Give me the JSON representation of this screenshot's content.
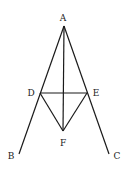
{
  "diagram": {
    "points": {
      "A": {
        "label": "A",
        "x": 64,
        "y": 26,
        "lx": 63,
        "ly": 21
      },
      "B": {
        "label": "B",
        "x": 19,
        "y": 154,
        "lx": 11,
        "ly": 159
      },
      "C": {
        "label": "C",
        "x": 109,
        "y": 154,
        "lx": 117,
        "ly": 159
      },
      "D": {
        "label": "D",
        "x": 40,
        "y": 93,
        "lx": 31,
        "ly": 96
      },
      "E": {
        "label": "E",
        "x": 87,
        "y": 93,
        "lx": 96,
        "ly": 96
      },
      "F": {
        "label": "F",
        "x": 63,
        "y": 131,
        "lx": 63,
        "ly": 146
      }
    },
    "segments": [
      [
        "A",
        "B"
      ],
      [
        "A",
        "C"
      ],
      [
        "A",
        "F"
      ],
      [
        "D",
        "E"
      ],
      [
        "D",
        "F"
      ],
      [
        "E",
        "F"
      ]
    ],
    "stroke_color": "#1a1a1a"
  }
}
